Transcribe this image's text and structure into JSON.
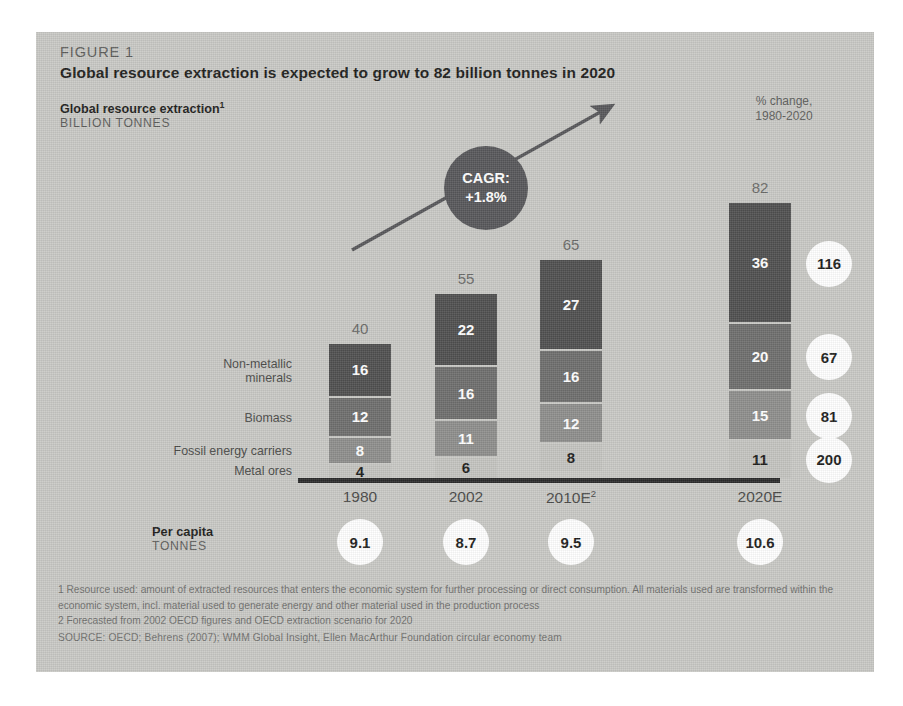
{
  "figure": {
    "kicker": "FIGURE 1",
    "title": "Global resource extraction is expected to grow to 82 billion tonnes in 2020",
    "axis_title": "Global resource extraction",
    "axis_title_footnote_marker": "1",
    "axis_subtitle": "BILLION TONNES",
    "pct_change_header_line1": "% change,",
    "pct_change_header_line2": "1980-2020",
    "percapita_label": "Per capita",
    "percapita_units": "TONNES",
    "cagr_line1": "CAGR:",
    "cagr_line2": "+1.8%",
    "footnote_1": "1 Resource used: amount of extracted resources that enters the economic system for further processing or direct consumption. All materials used are transformed within the economic system, incl. material used to generate energy and other material used in the production process",
    "footnote_2": "2 Forecasted from 2002 OECD figures and OECD extraction scenario for 2020",
    "source": "SOURCE: OECD; Behrens (2007); WMM Global Insight, Ellen MacArthur Foundation circular economy team"
  },
  "colors": {
    "panel_background": "#c9c9c5",
    "baseline": "#2b2b2b",
    "cagr_bubble": "#57575a",
    "circle_fill": "#ffffff",
    "series_metal_ores": "#c4c4c0",
    "series_fossil_energy": "#8e8e8c",
    "series_biomass": "#6e6e6d",
    "series_nonmetallic": "#4f4f4f"
  },
  "chart_data": {
    "type": "bar",
    "subtype": "stacked",
    "title": "Global resource extraction is expected to grow to 82 billion tonnes in 2020",
    "xlabel": "",
    "ylabel": "BILLION TONNES",
    "categories": [
      "1980",
      "2002",
      "2010E",
      "2020E"
    ],
    "category_footnote_markers": [
      "",
      "",
      "2",
      ""
    ],
    "grid": false,
    "legend_position": "left-inline",
    "ylim": [
      0,
      82
    ],
    "series": [
      {
        "name": "Metal ores",
        "values": [
          4,
          6,
          8,
          11
        ],
        "color": "#c4c4c0",
        "label_color": "dark"
      },
      {
        "name": "Fossil energy carriers",
        "values": [
          8,
          11,
          12,
          15
        ],
        "color": "#8e8e8c",
        "label_color": "light"
      },
      {
        "name": "Biomass",
        "values": [
          12,
          16,
          16,
          20
        ],
        "color": "#6e6e6d",
        "label_color": "light"
      },
      {
        "name": "Non-metallic minerals",
        "values": [
          16,
          22,
          27,
          36
        ],
        "color": "#4f4f4f",
        "label_color": "light"
      }
    ],
    "series_label_lines": [
      [
        "Metal ores"
      ],
      [
        "Fossil energy carriers"
      ],
      [
        "Biomass"
      ],
      [
        "Non-metallic",
        "minerals"
      ]
    ],
    "totals": [
      40,
      55,
      65,
      82
    ],
    "annotations": {
      "cagr": "+1.8%",
      "cagr_label": "CAGR:"
    },
    "pct_change_1980_2020": [
      {
        "series": "Metal ores",
        "value": 200
      },
      {
        "series": "Fossil energy carriers",
        "value": 81
      },
      {
        "series": "Biomass",
        "value": 67
      },
      {
        "series": "Non-metallic minerals",
        "value": 116
      }
    ],
    "per_capita_tonnes": [
      9.1,
      8.7,
      9.5,
      10.6
    ]
  }
}
